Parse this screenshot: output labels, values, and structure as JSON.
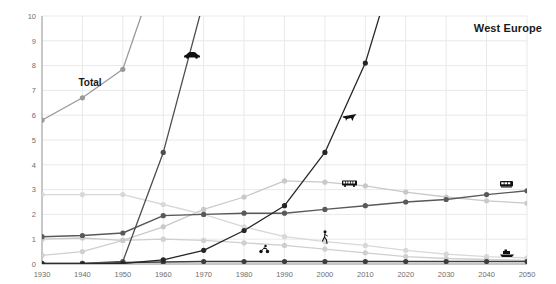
{
  "header": {
    "region_title": "West Europe"
  },
  "annotations": {
    "total_label": "Total"
  },
  "colors": {
    "background": "#ffffff",
    "grid": "#e9e9e9",
    "axis": "#9a9a9a",
    "tick_text": "#6e6e6e",
    "title_text": "#1a1a1a",
    "series_dark": "#262626",
    "series_darkgray": "#4d4d4d",
    "series_mid": "#8c8c8c",
    "series_light": "#c9c9c9",
    "series_lighter": "#d8d8d8",
    "series_palest": "#e0e0e0"
  },
  "chart_data": {
    "type": "line",
    "title": "West Europe",
    "xlabel": "",
    "ylabel": "",
    "xlim": [
      1930,
      2050
    ],
    "ylim": [
      0,
      10
    ],
    "grid": true,
    "legend": "icon-markers-inline",
    "x": [
      1930,
      1940,
      1950,
      1960,
      1970,
      1980,
      1990,
      2000,
      2010,
      2020,
      2030,
      2040,
      2050
    ],
    "xticks": [
      "1930",
      "1940",
      "1950",
      "1960",
      "1970",
      "1980",
      "1990",
      "2000",
      "2010",
      "2020",
      "2030",
      "2040",
      "2050"
    ],
    "yticks": [
      "0",
      "1",
      "2",
      "3",
      "4",
      "5",
      "6",
      "7",
      "8",
      "9",
      "10"
    ],
    "series": [
      {
        "name": "Total",
        "icon": "total-label",
        "color": "#9a9a9a",
        "label": "Total",
        "x": [
          1930,
          1940,
          1950,
          1960
        ],
        "values": [
          5.8,
          6.7,
          7.85,
          12.6
        ],
        "clipped_above_axis": true
      },
      {
        "name": "Car",
        "icon": "car-icon",
        "color": "#4d4d4d",
        "x": [
          1930,
          1940,
          1950,
          1960,
          1970
        ],
        "values": [
          0.02,
          0.02,
          0.1,
          4.5,
          10.6
        ],
        "clipped_above_axis": true
      },
      {
        "name": "Aviation",
        "icon": "plane-icon",
        "color": "#262626",
        "x": [
          1930,
          1940,
          1950,
          1960,
          1970,
          1980,
          1990,
          2000,
          2010,
          2020
        ],
        "values": [
          0.0,
          0.0,
          0.02,
          0.17,
          0.55,
          1.35,
          2.35,
          4.5,
          8.1,
          13.5
        ],
        "clipped_above_axis": true
      },
      {
        "name": "Bus",
        "icon": "bus-icon",
        "color": "#c9c9c9",
        "x": [
          1930,
          1940,
          1950,
          1960,
          1970,
          1980,
          1990,
          2000,
          2010,
          2020,
          2030,
          2040,
          2050
        ],
        "values": [
          1.0,
          1.05,
          0.95,
          1.5,
          2.2,
          2.7,
          3.35,
          3.3,
          3.15,
          2.9,
          2.7,
          2.55,
          2.45
        ]
      },
      {
        "name": "Rail",
        "icon": "train-icon",
        "color": "#595959",
        "x": [
          1930,
          1940,
          1950,
          1960,
          1970,
          1980,
          1990,
          2000,
          2010,
          2020,
          2030,
          2040,
          2050
        ],
        "values": [
          1.1,
          1.15,
          1.25,
          1.95,
          2.0,
          2.05,
          2.05,
          2.2,
          2.35,
          2.5,
          2.6,
          2.8,
          2.95
        ]
      },
      {
        "name": "Motorcycle",
        "icon": "motorcycle-icon",
        "color": "#d8d8d8",
        "x": [
          1930,
          1940,
          1950,
          1960,
          1970,
          1980,
          1990,
          2000,
          2010,
          2020,
          2030,
          2040,
          2050
        ],
        "values": [
          2.8,
          2.8,
          2.8,
          2.4,
          2.0,
          1.5,
          1.1,
          0.9,
          0.75,
          0.55,
          0.4,
          0.3,
          0.25
        ]
      },
      {
        "name": "Walking",
        "icon": "walking-icon",
        "color": "#cfcfcf",
        "x": [
          1930,
          1940,
          1950,
          1960,
          1970,
          1980,
          1990,
          2000,
          2010,
          2020,
          2030,
          2040,
          2050
        ],
        "values": [
          0.35,
          0.5,
          0.95,
          1.0,
          0.95,
          0.85,
          0.75,
          0.6,
          0.45,
          0.3,
          0.22,
          0.18,
          0.15
        ]
      },
      {
        "name": "Ship",
        "icon": "ship-icon",
        "color": "#3d3d3d",
        "x": [
          1930,
          1940,
          1950,
          1960,
          1970,
          1980,
          1990,
          2000,
          2010,
          2020,
          2030,
          2040,
          2050
        ],
        "values": [
          0.03,
          0.03,
          0.06,
          0.08,
          0.1,
          0.1,
          0.1,
          0.1,
          0.1,
          0.1,
          0.1,
          0.1,
          0.1
        ]
      }
    ],
    "icon_markers": [
      {
        "name": "car-icon",
        "x": 1967,
        "y": 8.45
      },
      {
        "name": "plane-icon",
        "x": 2006,
        "y": 6.0
      },
      {
        "name": "bus-icon",
        "x": 2006,
        "y": 3.25
      },
      {
        "name": "train-icon",
        "x": 2045,
        "y": 3.2
      },
      {
        "name": "motorcycle-icon",
        "x": 1985,
        "y": 0.62
      },
      {
        "name": "walking-icon",
        "x": 2000,
        "y": 1.08
      },
      {
        "name": "ship-icon",
        "x": 2045,
        "y": 0.42
      }
    ]
  }
}
